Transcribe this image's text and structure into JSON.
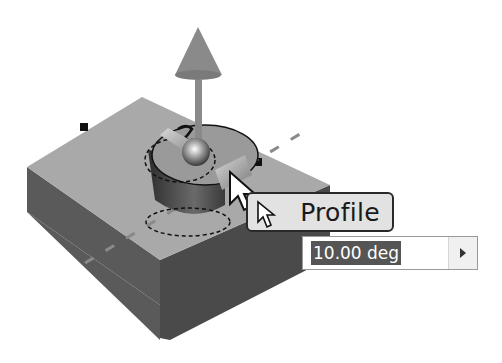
{
  "viewport": {
    "description": "3D CAD model: rectangular block with revolve/extrude manipulator gizmo"
  },
  "mini_toolbar": {
    "label": "Profile",
    "value_input": {
      "value": "10.00 deg",
      "selected": true
    },
    "dropdown_arrow": "right-arrow-icon"
  },
  "colors": {
    "top_face": "#a9a9a9",
    "front_face": "#5a5a5a",
    "side_face": "#4a4a4a",
    "gizmo": "#8a8a8a",
    "selection_highlight": "#555555"
  }
}
